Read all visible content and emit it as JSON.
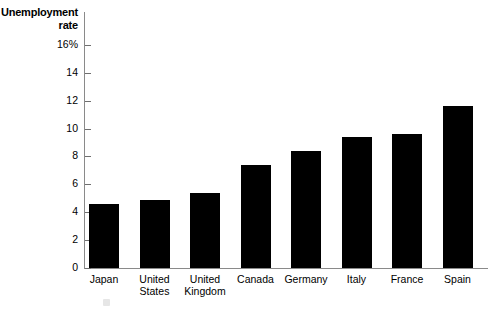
{
  "chart_data": {
    "type": "bar",
    "title": "",
    "xlabel": "",
    "ylabel": "Unemployment rate",
    "ylabel_lines": [
      "Unemployment",
      "rate"
    ],
    "categories": [
      "Japan",
      "United States",
      "United Kingdom",
      "Canada",
      "Germany",
      "Italy",
      "France",
      "Spain"
    ],
    "category_lines": [
      [
        "Japan"
      ],
      [
        "United",
        "States"
      ],
      [
        "United",
        "Kingdom"
      ],
      [
        "Canada"
      ],
      [
        "Germany"
      ],
      [
        "Italy"
      ],
      [
        "France"
      ],
      [
        "Spain"
      ]
    ],
    "values": [
      4.6,
      4.9,
      5.4,
      7.4,
      8.4,
      9.4,
      9.6,
      11.6
    ],
    "ylim": [
      0,
      16
    ],
    "yticks": [
      0,
      2,
      4,
      6,
      8,
      10,
      12,
      14,
      16
    ],
    "ytick_labels": [
      "0",
      "2",
      "4",
      "6",
      "8",
      "10",
      "12",
      "14",
      "16%"
    ],
    "grid": false,
    "legend": null,
    "bar_color": "#000000",
    "axis_color": "#8a8a8a",
    "background": "#ffffff"
  }
}
